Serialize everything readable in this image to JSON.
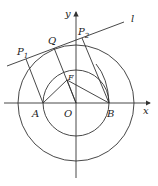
{
  "diagram": {
    "type": "geometry",
    "axes": {
      "x_label": "x",
      "y_label": "y",
      "origin_label": "O"
    },
    "points": {
      "A": "A",
      "B": "B",
      "O": "O",
      "F": "F",
      "Q": "Q",
      "P1": {
        "main": "P",
        "sub": "1"
      },
      "P2": {
        "main": "P",
        "sub": "2"
      }
    },
    "line_label": "l",
    "circles": [
      {
        "name": "small-circle",
        "center": "O",
        "through": [
          "A",
          "B"
        ]
      },
      {
        "name": "large-circle",
        "center": "O"
      }
    ],
    "color": "#333333"
  }
}
